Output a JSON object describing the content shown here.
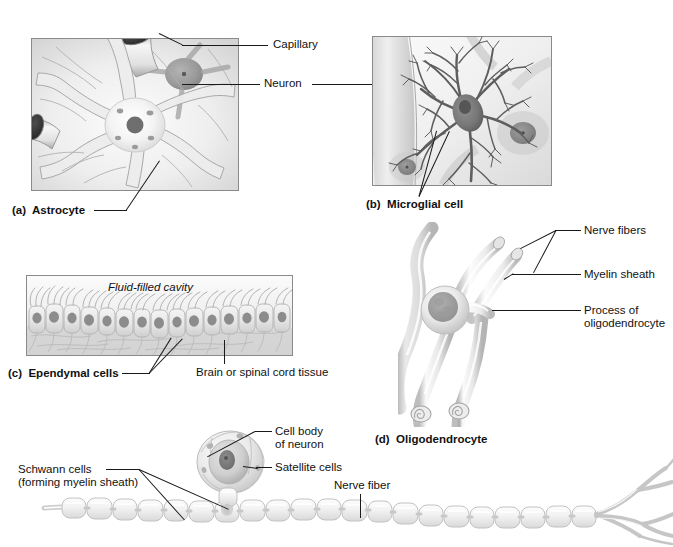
{
  "panels": [
    {
      "id": "a",
      "caption": "(a)  Astrocyte",
      "caption_prefix": "(a)",
      "caption_name": "Astrocyte",
      "labels": [
        "Capillary",
        "Neuron"
      ]
    },
    {
      "id": "b",
      "caption": "(b)  Microglial cell",
      "caption_prefix": "(b)",
      "caption_name": "Microglial cell",
      "labels": [
        "Neuron"
      ]
    },
    {
      "id": "c",
      "caption": "(c)  Ependymal cells",
      "caption_prefix": "(c)",
      "caption_name": "Ependymal cells",
      "labels": [
        "Fluid-filled cavity",
        "Brain or spinal cord tissue"
      ]
    },
    {
      "id": "d",
      "caption": "(d)  Oligodendrocyte",
      "caption_prefix": "(d)",
      "caption_name": "Oligodendrocyte",
      "labels": [
        "Nerve fibers",
        "Myelin sheath",
        "Process of oligodendrocyte"
      ]
    },
    {
      "id": "e",
      "caption": "",
      "labels": [
        "Cell body of neuron",
        "Satellite cells",
        "Schwann cells (forming myelin sheath)",
        "Nerve fiber"
      ]
    }
  ],
  "callouts": {
    "capillary": "Capillary",
    "neuron": "Neuron",
    "astrocyte_caption": "(a)  Astrocyte",
    "microglial_caption": "(b)  Microglial cell",
    "fluid_filled_cavity": "Fluid-filled cavity",
    "ependymal_caption": "(c)  Ependymal cells",
    "brain_or_spinal_cord_tissue": "Brain or spinal cord tissue",
    "nerve_fibers": "Nerve fibers",
    "myelin_sheath": "Myelin sheath",
    "process_of_oligodendrocyte_line1": "Process of",
    "process_of_oligodendrocyte_line2": "oligodendrocyte",
    "oligodendrocyte_caption": "(d)  Oligodendrocyte",
    "cell_body_line1": "Cell body",
    "cell_body_line2": "of neuron",
    "satellite_cells": "Satellite cells",
    "schwann_cells_line1": "Schwann cells",
    "schwann_cells_line2": "(forming myelin sheath)",
    "nerve_fiber": "Nerve fiber"
  },
  "colors": {
    "line": "#1a1a1a",
    "panel_border": "#8a8a8a",
    "tissue_light": "#f4f4f4",
    "tissue_mid": "#d8d8d8",
    "tissue_dark": "#9a9a9a",
    "nucleus": "#6e6e6e",
    "background": "#ffffff"
  }
}
